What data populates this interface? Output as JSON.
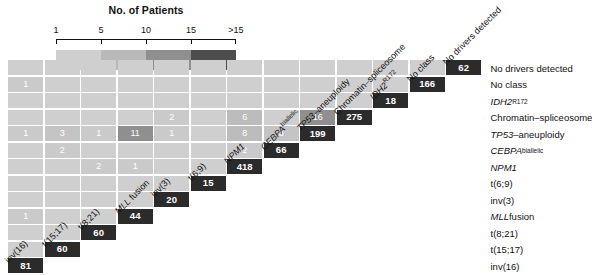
{
  "legend": {
    "title": "No. of Patients",
    "tick_labels": [
      "1",
      "5",
      "10",
      "15",
      ">15"
    ],
    "colors": [
      "#cfcfcf",
      "#b9b9b9",
      "#8f8f8f",
      "#4d4d4d"
    ]
  },
  "palette": {
    "diagonal": "#2b2b2b",
    "background": "#ffffff",
    "gridline": "#ffffff",
    "text": "#111111"
  },
  "chart_data": {
    "type": "heatmap",
    "title": "No. of Patients",
    "xlabel": "",
    "ylabel": "",
    "grid": true,
    "legend_position": "top",
    "categories": [
      "inv(16)",
      "t(15;17)",
      "t(8;21)",
      "MLL fusion",
      "inv(3)",
      "t(6;9)",
      "NPM1",
      "CEBPA-biallelic",
      "TP53-aneuploidy",
      "Chromatin-spliceosome",
      "IDH2-R172",
      "No class",
      "No drivers detected"
    ],
    "row_labels": [
      "No drivers detected",
      "No class",
      "IDH2R172",
      "Chromatin–spliceosome",
      "TP53–aneuploidy",
      "CEBPAbiallelic",
      "NPM1",
      "t(6;9)",
      "inv(3)",
      "MLL fusion",
      "t(8;21)",
      "t(15;17)",
      "inv(16)"
    ],
    "column_labels": [
      "inv(16)",
      "t(15;17)",
      "t(8;21)",
      "MLL fusion",
      "inv(3)",
      "t(6;9)",
      "NPM1",
      "CEBPAbiallelic",
      "TP53–aneuploidy",
      "Chromatin–spliceosome",
      "IDH2R172",
      "No class",
      "No drivers detected"
    ],
    "diagonal_values": [
      81,
      60,
      60,
      44,
      20,
      15,
      418,
      66,
      199,
      275,
      18,
      166,
      62
    ],
    "matrix_note": "Lower-triangular co-occurrence matrix; diagonal = class size, off-diagonal = co-occurring patients",
    "cells": [
      {
        "row": "inv(16)",
        "col": "inv(16)",
        "value": 81,
        "kind": "diagonal"
      },
      {
        "row": "t(15;17)",
        "col": "t(15;17)",
        "value": 60,
        "kind": "diagonal"
      },
      {
        "row": "t(8;21)",
        "col": "t(8;21)",
        "value": 60,
        "kind": "diagonal"
      },
      {
        "row": "MLL fusion",
        "col": "MLL fusion",
        "value": 44,
        "kind": "diagonal"
      },
      {
        "row": "inv(3)",
        "col": "inv(3)",
        "value": 20,
        "kind": "diagonal"
      },
      {
        "row": "t(6;9)",
        "col": "t(6;9)",
        "value": 15,
        "kind": "diagonal"
      },
      {
        "row": "NPM1",
        "col": "NPM1",
        "value": 418,
        "kind": "diagonal"
      },
      {
        "row": "CEBPAbiallelic",
        "col": "CEBPAbiallelic",
        "value": 66,
        "kind": "diagonal"
      },
      {
        "row": "TP53–aneuploidy",
        "col": "TP53–aneuploidy",
        "value": 199,
        "kind": "diagonal"
      },
      {
        "row": "Chromatin–spliceosome",
        "col": "Chromatin–spliceosome",
        "value": 275,
        "kind": "diagonal"
      },
      {
        "row": "IDH2R172",
        "col": "IDH2R172",
        "value": 18,
        "kind": "diagonal"
      },
      {
        "row": "No class",
        "col": "No class",
        "value": 166,
        "kind": "diagonal"
      },
      {
        "row": "No drivers detected",
        "col": "No drivers detected",
        "value": 62,
        "kind": "diagonal"
      },
      {
        "row": "NPM1",
        "col": "CEBPAbiallelic",
        "value": 2,
        "kind": "off"
      },
      {
        "row": "NPM1",
        "col": "TP53–aneuploidy",
        "value": 8,
        "kind": "off"
      },
      {
        "row": "NPM1",
        "col": "Chromatin–spliceosome",
        "value": 6,
        "kind": "off"
      },
      {
        "row": "CEBPAbiallelic",
        "col": "TP53–aneuploidy",
        "value": 3,
        "kind": "off"
      },
      {
        "row": "TP53–aneuploidy",
        "col": "Chromatin–spliceosome",
        "value": 16,
        "kind": "off"
      },
      {
        "row": "inv(3)",
        "col": "TP53–aneuploidy",
        "value": 1,
        "kind": "off"
      },
      {
        "row": "inv(3)",
        "col": "Chromatin–spliceosome",
        "value": 2,
        "kind": "off"
      },
      {
        "row": "MLL fusion",
        "col": "NPM1",
        "value": 1,
        "kind": "off"
      },
      {
        "row": "MLL fusion",
        "col": "TP53–aneuploidy",
        "value": 11,
        "kind": "off"
      },
      {
        "row": "t(8;21)",
        "col": "NPM1",
        "value": 2,
        "kind": "off"
      },
      {
        "row": "t(8;21)",
        "col": "TP53–aneuploidy",
        "value": 1,
        "kind": "off"
      },
      {
        "row": "t(15;17)",
        "col": "CEBPAbiallelic",
        "value": 2,
        "kind": "off"
      },
      {
        "row": "t(15;17)",
        "col": "TP53–aneuploidy",
        "value": 3,
        "kind": "off"
      },
      {
        "row": "inv(16)",
        "col": "MLL fusion",
        "value": 1,
        "kind": "off"
      },
      {
        "row": "inv(16)",
        "col": "TP53–aneuploidy",
        "value": 1,
        "kind": "off"
      },
      {
        "row": "inv(16)",
        "col": "No class",
        "value": 1,
        "kind": "off"
      }
    ]
  }
}
